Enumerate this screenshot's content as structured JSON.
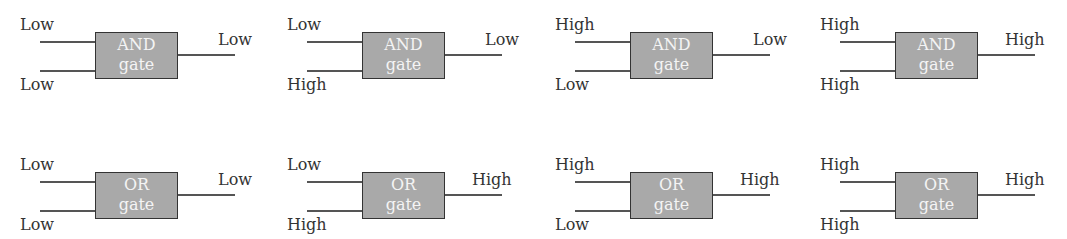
{
  "diagram": {
    "title": "",
    "colors": {
      "box_fill": "#a9a9a9",
      "box_border": "#333333",
      "wire": "#555555",
      "text": "#333333",
      "box_text": "#f4f4f4"
    },
    "rows": [
      {
        "type": "AND",
        "gates": [
          {
            "name": "AND",
            "sub": "gate",
            "in1": "Low",
            "in2": "Low",
            "out": "Low"
          },
          {
            "name": "AND",
            "sub": "gate",
            "in1": "Low",
            "in2": "High",
            "out": "Low"
          },
          {
            "name": "AND",
            "sub": "gate",
            "in1": "High",
            "in2": "Low",
            "out": "Low"
          },
          {
            "name": "AND",
            "sub": "gate",
            "in1": "High",
            "in2": "High",
            "out": "High"
          }
        ]
      },
      {
        "type": "OR",
        "gates": [
          {
            "name": "OR",
            "sub": "gate",
            "in1": "Low",
            "in2": "Low",
            "out": "Low"
          },
          {
            "name": "OR",
            "sub": "gate",
            "in1": "Low",
            "in2": "High",
            "out": "High"
          },
          {
            "name": "OR",
            "sub": "gate",
            "in1": "High",
            "in2": "Low",
            "out": "High"
          },
          {
            "name": "OR",
            "sub": "gate",
            "in1": "High",
            "in2": "High",
            "out": "High"
          }
        ]
      }
    ]
  }
}
